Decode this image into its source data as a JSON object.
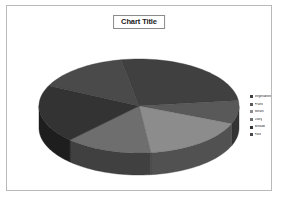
{
  "chart": {
    "title": "Chart Title",
    "frame_border_color": "#b9b9b9",
    "background_color": "#ffffff"
  },
  "legend": {
    "position": "right",
    "entries": [
      {
        "label": "Vegetables",
        "color": "#404040"
      },
      {
        "label": "Fruits",
        "color": "#595959"
      },
      {
        "label": "Meats",
        "color": "#8c8c8c"
      },
      {
        "label": "Dairy",
        "color": "#6e6e6e"
      },
      {
        "label": "Breads",
        "color": "#333333"
      },
      {
        "label": "Fats",
        "color": "#4a4a4a"
      }
    ]
  },
  "chart_data": {
    "type": "pie",
    "title": "Chart Title",
    "three_d": true,
    "legend_position": "right",
    "categories": [
      "Vegetables",
      "Fruits",
      "Meats",
      "Dairy",
      "Breads",
      "Fats"
    ],
    "values": [
      26,
      8,
      17,
      14,
      20,
      15
    ],
    "colors": [
      "#404040",
      "#595959",
      "#8c8c8c",
      "#6e6e6e",
      "#333333",
      "#4a4a4a"
    ],
    "xlabel": "",
    "ylabel": ""
  }
}
